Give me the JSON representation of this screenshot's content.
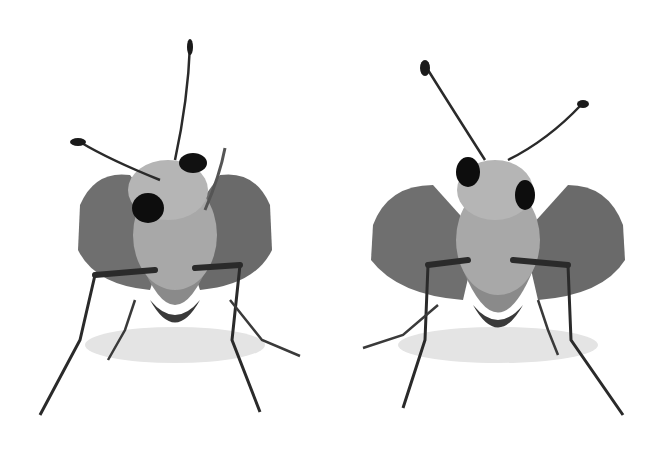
{
  "scene": {
    "description": "Two grayscale front-view photographs of skipper butterflies side by side on white background",
    "background": "#ffffff",
    "subjects": [
      {
        "name": "skipper-left",
        "x": 40,
        "y": 40,
        "width": 270,
        "height": 380
      },
      {
        "name": "skipper-right",
        "x": 360,
        "y": 60,
        "width": 270,
        "height": 360
      }
    ],
    "colors": {
      "wing": "#6f6f6f",
      "wing_dark": "#4a4a4a",
      "body": "#9a9a9a",
      "eye": "#0d0d0d",
      "leg": "#2a2a2a",
      "shadow": "#d8d8d8"
    }
  }
}
